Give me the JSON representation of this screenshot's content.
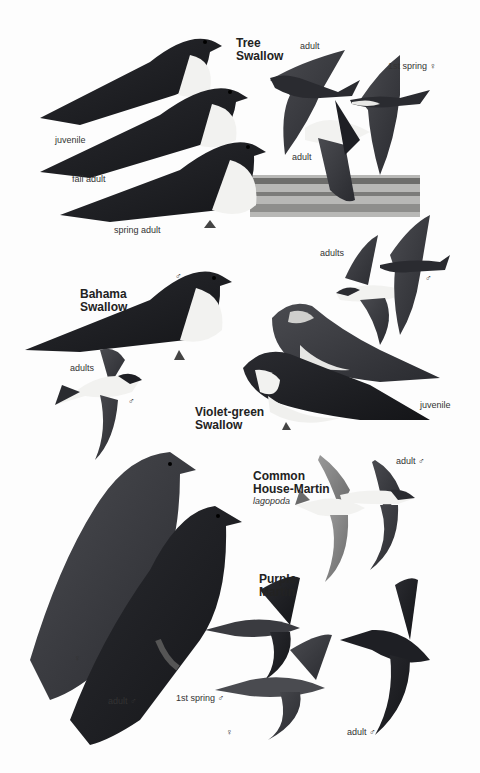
{
  "plate": {
    "species": [
      {
        "name": "Tree Swallow",
        "title_lines": "Tree\nSwallow",
        "labels": [
          "adult",
          "1st spring ♀",
          "juvenile",
          "fall adult",
          "adult",
          "spring adult"
        ]
      },
      {
        "name": "Bahama Swallow",
        "title_lines": "Bahama\nSwallow",
        "labels": [
          "♂",
          "adults",
          "♂"
        ]
      },
      {
        "name": "Violet-green Swallow",
        "title_lines": "Violet-green\nSwallow",
        "labels": [
          "adults",
          "♂",
          "♂",
          "juvenile",
          "adult ♂"
        ]
      },
      {
        "name": "Common House-Martin",
        "title_lines": "Common\nHouse-Martin",
        "subspecies": "lagopoda",
        "labels": []
      },
      {
        "name": "Purple Martin",
        "title_lines": "Purple\nMartin",
        "labels": [
          "♀",
          "adult ♂",
          "1st spring ♂",
          "♀",
          "adult ♂"
        ]
      }
    ]
  },
  "colors": {
    "background": "#fdfdfd",
    "bird_dark": "#1e1f24",
    "bird_mid": "#3a3b40",
    "bird_white": "#f2f2f0",
    "marsh": "#8a8a88"
  }
}
